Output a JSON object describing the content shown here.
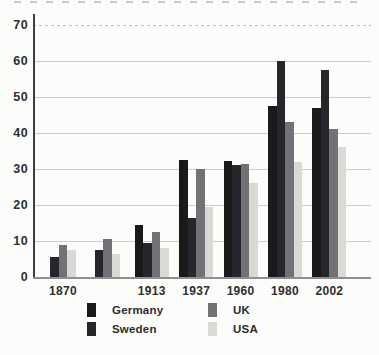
{
  "chart_data": {
    "type": "bar",
    "title": "",
    "xlabel": "",
    "ylabel": "",
    "ylim": [
      0,
      70
    ],
    "yticks": [
      "0",
      "10",
      "20",
      "30",
      "40",
      "50",
      "60",
      "70"
    ],
    "grid": true,
    "legend_position": "bottom",
    "categories": [
      "1870",
      "",
      "1913",
      "1937",
      "1960",
      "1980",
      "2002"
    ],
    "series": [
      {
        "name": "Germany",
        "color": "#1a1a1a",
        "values": [
          null,
          null,
          14.5,
          32.5,
          32.3,
          47.5,
          47.0
        ]
      },
      {
        "name": "Sweden",
        "color": "#26262c",
        "values": [
          5.5,
          7.5,
          9.5,
          16.5,
          31.0,
          60.0,
          57.5
        ]
      },
      {
        "name": "UK",
        "color": "#727276",
        "values": [
          9.0,
          10.5,
          12.5,
          30.0,
          31.5,
          43.0,
          41.0
        ]
      },
      {
        "name": "USA",
        "color": "#d9d9d5",
        "values": [
          7.5,
          6.5,
          8.0,
          19.5,
          26.0,
          32.0,
          36.0
        ]
      }
    ]
  }
}
